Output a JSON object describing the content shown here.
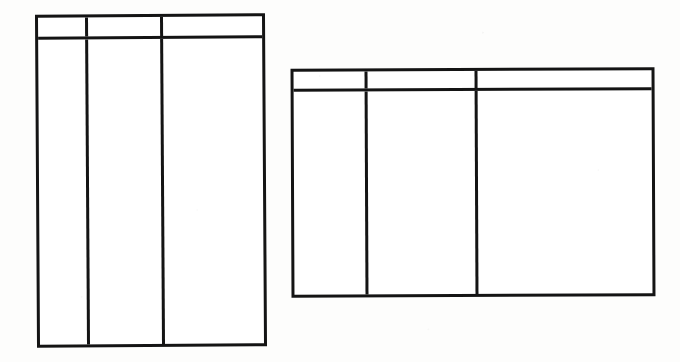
{
  "document": {
    "kind": "scanned-blank-table-forms",
    "background_color": "#fdfdfc",
    "ink_color": "#141414",
    "cell_fill_color": "#ffffff",
    "forms_count": 2
  },
  "forms": [
    {
      "id": "form-left",
      "name": "left-portrait-table",
      "orientation": "portrait",
      "columns_count": 3,
      "header_row": {
        "cells": [
          "",
          "",
          ""
        ]
      },
      "body_row": {
        "cells": [
          "",
          "",
          ""
        ]
      }
    },
    {
      "id": "form-right",
      "name": "right-landscape-table",
      "orientation": "landscape",
      "columns_count": 3,
      "header_row": {
        "cells": [
          "",
          "",
          ""
        ]
      },
      "body_row": {
        "cells": [
          "",
          "",
          ""
        ]
      }
    }
  ]
}
